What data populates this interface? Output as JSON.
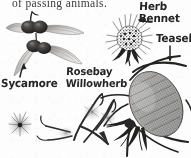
{
  "page": {
    "width": 191,
    "height": 158,
    "background_color": "#fdfdfc",
    "ink_color": "#262524",
    "body_text_color": "#3a3a38",
    "medium": "scanned pen-and-ink botanical illustration"
  },
  "body_text": {
    "line": "of passing animals.",
    "note": "clipped at top edge of image"
  },
  "labels": {
    "sycamore": "Sycamore",
    "rosebay_line1": "Rosebay",
    "rosebay_line2": "Willowherb",
    "herb_bennet_line1": "Herb",
    "herb_bennet_line2": "Bennet",
    "teasel": "Teasel"
  },
  "illustrations": [
    {
      "name": "sycamore-samaras",
      "label": "Sycamore",
      "description": "pair of winged maple seeds (samaras) with dark swollen seed bodies and pale veined wings",
      "arrow": "up-left from label"
    },
    {
      "name": "herb-bennet-burr",
      "label": "Herb Bennet",
      "description": "round spiky burr seed head with radiating hooked bristles on a short stalk",
      "arrow": "left from label"
    },
    {
      "name": "teasel-head",
      "label": "Teasel",
      "description": "large oval prickly seed head with long curving spiny bracts",
      "arrow": "down from label"
    },
    {
      "name": "rosebay-willowherb-pods",
      "label": "Rosebay Willowherb",
      "description": "curling split seed pods releasing fluffy plumed seeds",
      "arrow": "down-left from label"
    },
    {
      "name": "drifting-plumed-seed",
      "label": "",
      "description": "small detached fluffy parachute seed floating at lower left"
    }
  ]
}
